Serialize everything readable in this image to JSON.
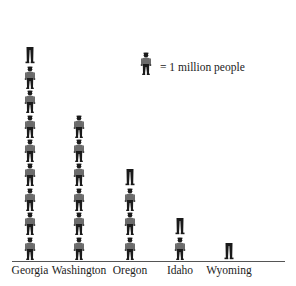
{
  "chart_data": {
    "type": "pictograph",
    "title": "",
    "xlabel": "",
    "ylabel": "",
    "unit_icon": "person-icon",
    "unit_value": 1,
    "legend": "= 1 million people",
    "categories": [
      "Georgia",
      "Washington",
      "Oregon",
      "Idaho",
      "Wyoming"
    ],
    "values": [
      8.5,
      6,
      3.5,
      1.5,
      0.5
    ],
    "value_unit": "million people",
    "colors": {
      "figure": "#1a1a1a",
      "shirt": "#6b6b6b",
      "axis": "#555555",
      "text": "#222222"
    }
  },
  "legend": {
    "text": "= 1 million people"
  },
  "columns": [
    {
      "label": "Georgia",
      "value": 8.5,
      "x": 30
    },
    {
      "label": "Washington",
      "value": 6,
      "x": 79
    },
    {
      "label": "Oregon",
      "value": 3.5,
      "x": 130
    },
    {
      "label": "Idaho",
      "value": 1.5,
      "x": 180
    },
    {
      "label": "Wyoming",
      "value": 0.5,
      "x": 229
    }
  ]
}
